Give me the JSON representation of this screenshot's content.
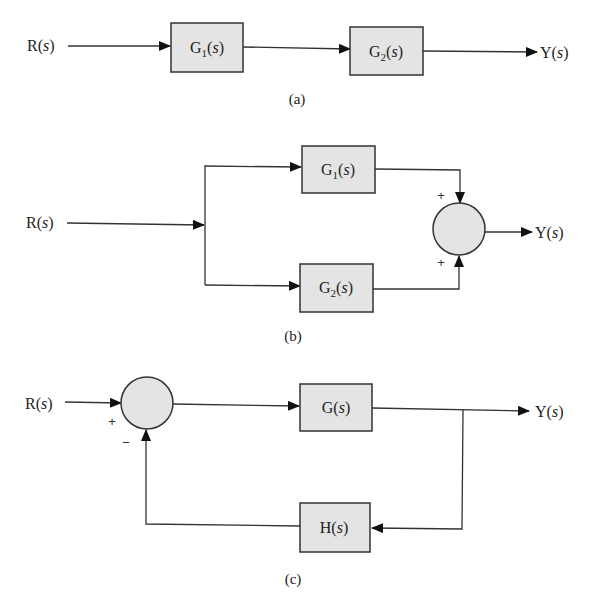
{
  "figure": {
    "panels": [
      {
        "id": "a",
        "caption": "(a)",
        "description": "Series connection",
        "input_label": "R(s)",
        "output_label": "Y(s)",
        "blocks": [
          {
            "name": "G",
            "sub": "1",
            "arg": "s"
          },
          {
            "name": "G",
            "sub": "2",
            "arg": "s"
          }
        ]
      },
      {
        "id": "b",
        "caption": "(b)",
        "description": "Parallel connection",
        "input_label": "R(s)",
        "output_label": "Y(s)",
        "blocks": [
          {
            "name": "G",
            "sub": "1",
            "arg": "s"
          },
          {
            "name": "G",
            "sub": "2",
            "arg": "s"
          }
        ],
        "summing_junction": {
          "signs": [
            "+",
            "+"
          ]
        }
      },
      {
        "id": "c",
        "caption": "(c)",
        "description": "Feedback connection",
        "input_label": "R(s)",
        "output_label": "Y(s)",
        "blocks": [
          {
            "name": "G",
            "sub": "",
            "arg": "s"
          },
          {
            "name": "H",
            "sub": "",
            "arg": "s"
          }
        ],
        "summing_junction": {
          "signs": [
            "+",
            "−"
          ]
        }
      }
    ],
    "colors": {
      "block_fill": "#e4e4e4",
      "stroke": "#333333",
      "background": "#ffffff"
    }
  }
}
